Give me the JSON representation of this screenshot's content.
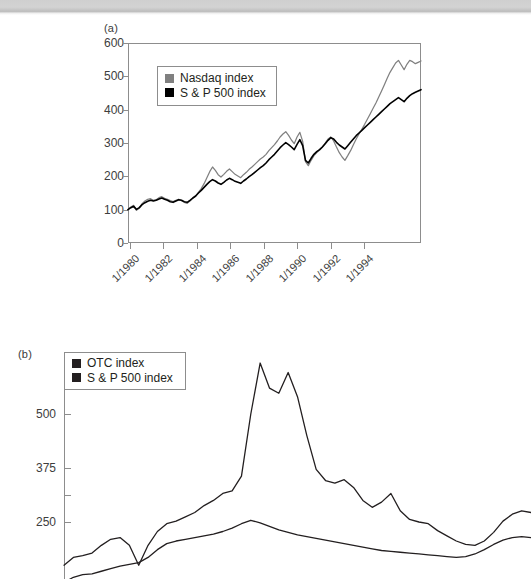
{
  "figure": {
    "panels": [
      {
        "tag": "(a)"
      },
      {
        "tag": "(b)"
      }
    ]
  },
  "chart_data": [
    {
      "panel": "(a)",
      "type": "line",
      "title": "",
      "xlabel": "",
      "ylabel": "",
      "ylim": [
        0,
        600
      ],
      "yticks": [
        0,
        100,
        200,
        300,
        400,
        500,
        600
      ],
      "xticks": [
        "1/1980",
        "1/1982",
        "1/1984",
        "1/1986",
        "1/1988",
        "1/1990",
        "1/1992",
        "1/1994"
      ],
      "grid": false,
      "legend_position": "top-left-inside",
      "legend": [
        "Nasdaq index",
        "S & P 500 index"
      ],
      "colors": {
        "nasdaq": "#808080",
        "sp500": "#000000"
      },
      "x_start": "1/1980",
      "x_end": "7/1995",
      "series": [
        {
          "name": "Nasdaq index",
          "color": "#808080",
          "values": [
            100,
            108,
            113,
            98,
            104,
            118,
            126,
            131,
            133,
            128,
            130,
            136,
            139,
            134,
            131,
            127,
            124,
            128,
            131,
            127,
            122,
            119,
            126,
            134,
            140,
            152,
            163,
            178,
            196,
            214,
            228,
            218,
            205,
            198,
            206,
            215,
            222,
            214,
            206,
            201,
            196,
            205,
            212,
            221,
            228,
            236,
            244,
            252,
            258,
            266,
            277,
            286,
            295,
            306,
            318,
            327,
            334,
            323,
            309,
            298,
            318,
            332,
            305,
            244,
            232,
            248,
            262,
            271,
            279,
            288,
            300,
            312,
            318,
            306,
            288,
            271,
            258,
            248,
            262,
            277,
            295,
            312,
            327,
            341,
            356,
            372,
            388,
            404,
            420,
            438,
            456,
            475,
            494,
            512,
            526,
            540,
            548,
            534,
            520,
            536,
            548,
            544,
            538,
            542,
            546
          ]
        },
        {
          "name": "S & P 500 index",
          "color": "#000000",
          "values": [
            100,
            106,
            110,
            101,
            106,
            115,
            121,
            125,
            128,
            126,
            128,
            132,
            135,
            131,
            128,
            124,
            122,
            126,
            130,
            128,
            124,
            122,
            128,
            135,
            141,
            150,
            158,
            167,
            176,
            184,
            190,
            186,
            180,
            176,
            182,
            189,
            194,
            190,
            185,
            182,
            179,
            186,
            192,
            199,
            205,
            212,
            219,
            226,
            232,
            240,
            250,
            258,
            266,
            276,
            286,
            294,
            301,
            295,
            288,
            280,
            296,
            310,
            292,
            248,
            240,
            254,
            266,
            274,
            280,
            288,
            298,
            308,
            316,
            312,
            302,
            294,
            288,
            282,
            292,
            302,
            312,
            322,
            330,
            338,
            346,
            354,
            362,
            370,
            378,
            386,
            394,
            402,
            410,
            418,
            424,
            430,
            436,
            430,
            424,
            434,
            442,
            448,
            452,
            456,
            460
          ]
        }
      ]
    },
    {
      "panel": "(b)",
      "type": "line",
      "title": "",
      "xlabel": "",
      "ylabel": "",
      "note": "lower portion of panel (b) is cropped by the screenshot edge",
      "yticks_labeled": [
        500,
        375,
        250
      ],
      "yticks_unlabeled": [
        312
      ],
      "grid": false,
      "legend_position": "top-left-inside",
      "legend": [
        "OTC index",
        "S & P 500 index"
      ],
      "colors": {
        "otc": "#000000",
        "sp500": "#000000"
      },
      "series": [
        {
          "name": "OTC index",
          "color": "#231f20",
          "values": [
            150,
            168,
            172,
            178,
            196,
            210,
            214,
            196,
            150,
            196,
            228,
            246,
            252,
            262,
            272,
            288,
            300,
            316,
            322,
            356,
            500,
            618,
            560,
            548,
            596,
            540,
            450,
            372,
            346,
            340,
            348,
            330,
            300,
            284,
            296,
            316,
            276,
            256,
            250,
            246,
            230,
            218,
            206,
            198,
            196,
            206,
            226,
            252,
            268,
            276,
            272
          ]
        },
        {
          "name": "S & P 500 index",
          "color": "#231f20",
          "values": [
            110,
            122,
            128,
            130,
            136,
            142,
            148,
            152,
            156,
            168,
            186,
            200,
            206,
            210,
            214,
            218,
            222,
            228,
            236,
            246,
            254,
            248,
            240,
            232,
            226,
            220,
            216,
            212,
            208,
            204,
            200,
            196,
            192,
            188,
            184,
            182,
            180,
            178,
            176,
            174,
            172,
            170,
            168,
            170,
            176,
            186,
            198,
            208,
            214,
            216,
            214
          ]
        }
      ]
    }
  ]
}
